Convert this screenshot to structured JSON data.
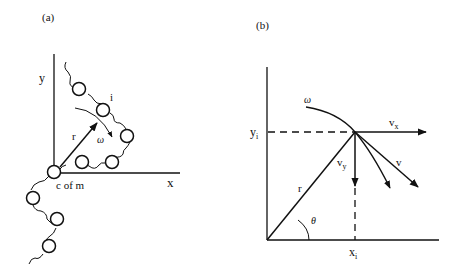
{
  "panel_a": {
    "label": "(a)",
    "axis_x": "x",
    "axis_y": "y",
    "radius_label": "r",
    "omega_label": "ω",
    "bead_label": "i",
    "origin_label": "c of m"
  },
  "panel_b": {
    "label": "(b)",
    "omega_label": "ω",
    "vx_label": "v",
    "vx_sub": "x",
    "vy_label": "v",
    "vy_sub": "y",
    "v_label": "v",
    "r_label": "r",
    "theta_label": "θ",
    "yi_label": "y",
    "yi_sub": "i",
    "xi_label": "x",
    "xi_sub": "i"
  },
  "colors": {
    "ink": "#111111",
    "background": "#ffffff"
  }
}
